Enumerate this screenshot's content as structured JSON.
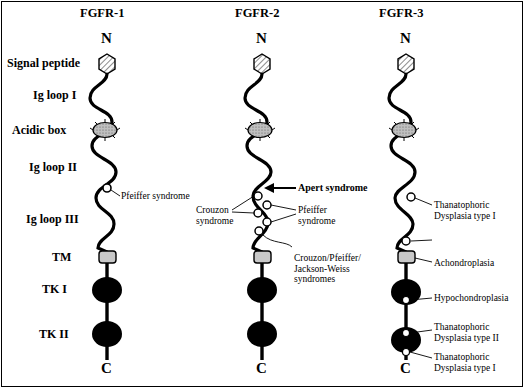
{
  "figure": {
    "background": "#ffffff",
    "border_color": "#000000"
  },
  "columns": [
    {
      "id": "fgfr1",
      "title": "FGFR-1",
      "n_label": "N",
      "c_label": "C"
    },
    {
      "id": "fgfr2",
      "title": "FGFR-2",
      "n_label": "N",
      "c_label": "C"
    },
    {
      "id": "fgfr3",
      "title": "FGFR-3",
      "n_label": "N",
      "c_label": "C"
    }
  ],
  "domain_labels": [
    {
      "id": "signal-peptide",
      "text": "Signal peptide"
    },
    {
      "id": "ig-loop-1",
      "text": "Ig loop I"
    },
    {
      "id": "acidic-box",
      "text": "Acidic box"
    },
    {
      "id": "ig-loop-2",
      "text": "Ig loop II"
    },
    {
      "id": "ig-loop-3",
      "text": "Ig loop III"
    },
    {
      "id": "tm",
      "text": "TM"
    },
    {
      "id": "tk-1",
      "text": "TK I"
    },
    {
      "id": "tk-2",
      "text": "TK II"
    }
  ],
  "annotations": {
    "fgfr1": [
      {
        "id": "pfeiffer-1",
        "text": "Pfeiffer syndrome",
        "bold": false
      }
    ],
    "fgfr2": [
      {
        "id": "apert",
        "text": "Apert syndrome",
        "bold": true
      },
      {
        "id": "crouzon",
        "text": "Crouzon\nsyndrome",
        "bold": false
      },
      {
        "id": "pfeiffer-2",
        "text": "Pfeiffer\nsyndrome",
        "bold": false
      },
      {
        "id": "crouzon-pfeiffer-jw",
        "text": "Crouzon/Pfeiffer/\nJackson-Weiss\nsyndromes",
        "bold": false
      }
    ],
    "fgfr3": [
      {
        "id": "thanatophoric-1",
        "text": "Thanatophoric\nDysplasia type I",
        "bold": false
      },
      {
        "id": "achondroplasia",
        "text": "Achondroplasia",
        "bold": false
      },
      {
        "id": "hypochondroplasia",
        "text": "Hypochondroplasia",
        "bold": false
      },
      {
        "id": "thanatophoric-2",
        "text": "Thanatophoric\nDysplasia type II",
        "bold": false
      },
      {
        "id": "thanatophoric-3",
        "text": "Thanatophoric\nDysplasia type I",
        "bold": false
      }
    ]
  },
  "legend_shapes": {
    "signal_peptide": "hexagon-hatched",
    "acidic_box": "ellipse-stippled",
    "tm": "rounded-rect-gray",
    "tk": "filled-ellipse-black",
    "mutation_marker": "open-circle"
  }
}
